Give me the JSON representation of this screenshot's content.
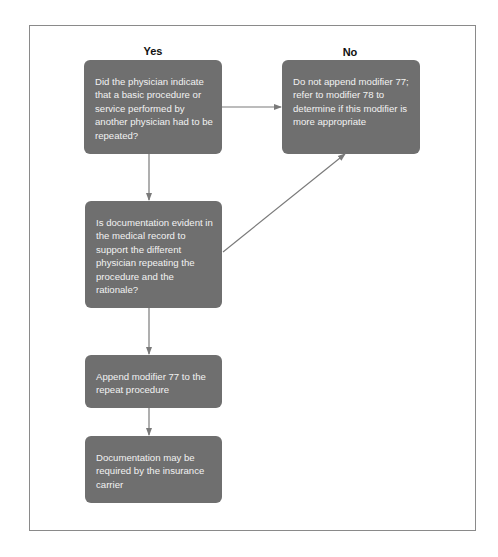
{
  "columns": {
    "yes": "Yes",
    "no": "No"
  },
  "nodes": [
    {
      "id": "q1",
      "text": "Did the physician indicate that a basic procedure or service performed by another physician had to be repeated?"
    },
    {
      "id": "no_result",
      "text": "Do not append modifier 77; refer to modifier 78 to determine if this modifier is more appropriate"
    },
    {
      "id": "q2",
      "text": "Is documentation evident in the medical record to support the different physician repeating the procedure and the rationale?"
    },
    {
      "id": "append",
      "text": "Append modifier 77 to the repeat procedure"
    },
    {
      "id": "doc",
      "text": "Documentation may be required by the insurance carrier"
    }
  ],
  "colors": {
    "box": "#6f6f6f",
    "box_text": "#f2f2f2",
    "arrow": "#7a7a7a",
    "frame": "#8a8a8a"
  }
}
